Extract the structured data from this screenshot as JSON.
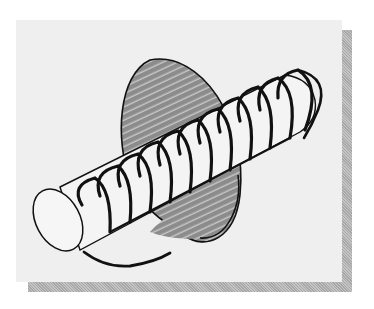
{
  "figure": {
    "description_label": "",
    "colors": {
      "card_background": "#efefef",
      "shadow": "#b4b4b4",
      "disc_fill": "#8c8c8c",
      "stroke": "#111111",
      "cylinder_fill": "#f4f4f4"
    },
    "elements": {
      "cylinder": {
        "end_cap_center": [
          62,
          217
        ],
        "axis_end": [
          300,
          85
        ]
      },
      "disc": {
        "center": [
          180,
          155
        ],
        "rx": 55,
        "ry": 98,
        "rotate": -20
      },
      "coil_turns": 11,
      "field_arc_bottom": true,
      "field_arc_top_right": true
    }
  }
}
